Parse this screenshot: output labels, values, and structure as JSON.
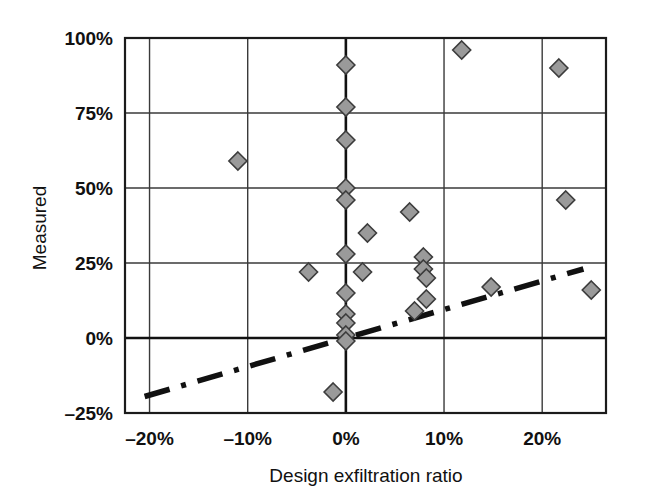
{
  "chart_data": {
    "type": "scatter",
    "title": "",
    "xlabel": "Design exfiltration ratio",
    "ylabel": "Measured",
    "xlim": [
      -22.5,
      26.5
    ],
    "ylim": [
      -25,
      100
    ],
    "xticks": [
      -20,
      -10,
      0,
      10,
      20
    ],
    "xtick_labels": [
      "–20%",
      "–10%",
      "0%",
      "10%",
      "20%"
    ],
    "yticks": [
      -25,
      0,
      25,
      50,
      75,
      100
    ],
    "ytick_labels": [
      "–25%",
      "0%",
      "25%",
      "50%",
      "75%",
      "100%"
    ],
    "grid": true,
    "legend": "none",
    "marker_shape": "diamond",
    "marker_fill": "#9a9a9a",
    "marker_edge": "#3c3c3c",
    "points": [
      {
        "x": -11.0,
        "y": 59
      },
      {
        "x": -3.8,
        "y": 22
      },
      {
        "x": -1.3,
        "y": -18
      },
      {
        "x": 0.0,
        "y": 91
      },
      {
        "x": 0.0,
        "y": 77
      },
      {
        "x": 0.0,
        "y": 66
      },
      {
        "x": 0.0,
        "y": 50
      },
      {
        "x": 0.0,
        "y": 46
      },
      {
        "x": 0.0,
        "y": 28
      },
      {
        "x": 0.0,
        "y": 15
      },
      {
        "x": 0.0,
        "y": 8
      },
      {
        "x": 0.0,
        "y": 5
      },
      {
        "x": 0.0,
        "y": 1
      },
      {
        "x": 0.0,
        "y": -1
      },
      {
        "x": 1.7,
        "y": 22
      },
      {
        "x": 2.2,
        "y": 35
      },
      {
        "x": 6.5,
        "y": 42
      },
      {
        "x": 7.0,
        "y": 9
      },
      {
        "x": 7.9,
        "y": 27
      },
      {
        "x": 7.9,
        "y": 23
      },
      {
        "x": 8.2,
        "y": 20
      },
      {
        "x": 8.2,
        "y": 13
      },
      {
        "x": 11.8,
        "y": 96
      },
      {
        "x": 14.8,
        "y": 17
      },
      {
        "x": 21.7,
        "y": 90
      },
      {
        "x": 22.4,
        "y": 46
      },
      {
        "x": 25.0,
        "y": 16
      }
    ],
    "trendline": {
      "style": "dash-dot",
      "color": "#111111",
      "x_start": -20.5,
      "y_start": -19.5,
      "x_end": 24.2,
      "y_end": 23.0
    }
  },
  "axes": {
    "y_title": "Measured",
    "x_title": "Design exfiltration ratio"
  }
}
